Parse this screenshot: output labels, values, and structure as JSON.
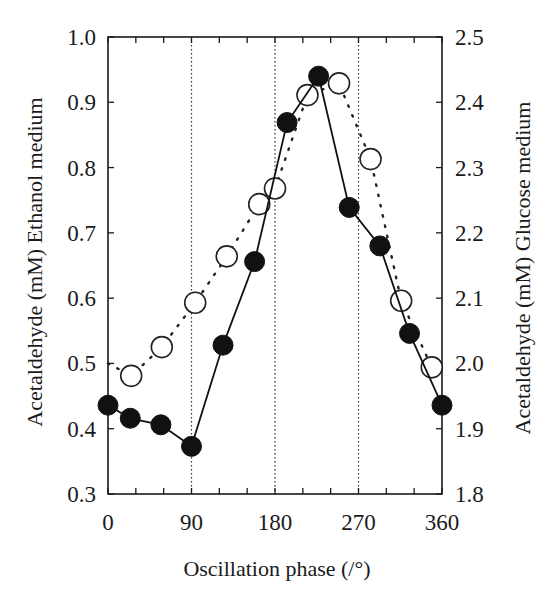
{
  "chart_data": {
    "type": "line",
    "title": "",
    "xlabel": "Oscillation phase (/°)",
    "ylabel_left": "Acetaldehyde (mM)  Ethanol medium",
    "ylabel_right": "Acetaldehyde  (mM) Glucose medium",
    "xlim": [
      0,
      360
    ],
    "ylim_left": [
      0.3,
      1.0
    ],
    "ylim_right": [
      1.8,
      2.5
    ],
    "x_ticks": [
      0,
      90,
      180,
      270,
      360
    ],
    "x_tick_labels": [
      "0",
      "90",
      "180",
      "270",
      "360"
    ],
    "x_minor_ticks": [
      30,
      60,
      120,
      150,
      210,
      240,
      300,
      330
    ],
    "y_left_ticks": [
      0.3,
      0.4,
      0.5,
      0.6,
      0.7,
      0.8,
      0.9,
      1.0
    ],
    "y_left_tick_labels": [
      "0.3",
      "0.4",
      "0.5",
      "0.6",
      "0.7",
      "0.8",
      "0.9",
      "1.0"
    ],
    "y_right_ticks": [
      1.8,
      1.9,
      2.0,
      2.1,
      2.2,
      2.3,
      2.4,
      2.5
    ],
    "y_right_tick_labels": [
      "1.8",
      "1.9",
      "2.0",
      "2.1",
      "2.2",
      "2.3",
      "2.4",
      "2.5"
    ],
    "vertical_gridlines": [
      90,
      180,
      270
    ],
    "grid": "dotted vertical lines at 90, 180, 270",
    "legend": null,
    "series": [
      {
        "name": "Ethanol medium",
        "axis": "left",
        "marker": "filled-circle",
        "line": "solid",
        "x": [
          0,
          24,
          57,
          90,
          124,
          158,
          193,
          227,
          260,
          293,
          325,
          360
        ],
        "y": [
          0.436,
          0.416,
          0.406,
          0.373,
          0.528,
          0.656,
          0.869,
          0.94,
          0.739,
          0.68,
          0.546,
          0.436
        ]
      },
      {
        "name": "Glucose medium",
        "axis": "right",
        "marker": "open-circle",
        "line": "dotted",
        "line_start": {
          "x": 0,
          "y": 2.0
        },
        "x": [
          25,
          58,
          94,
          128,
          163,
          180,
          215,
          249,
          283,
          316,
          349
        ],
        "y": [
          1.981,
          2.025,
          2.093,
          2.164,
          2.244,
          2.268,
          2.411,
          2.429,
          2.313,
          2.096,
          1.994
        ]
      }
    ]
  },
  "colors": {
    "ink": "#111111",
    "background": "#ffffff",
    "open_marker_fill": "#ffffff"
  }
}
